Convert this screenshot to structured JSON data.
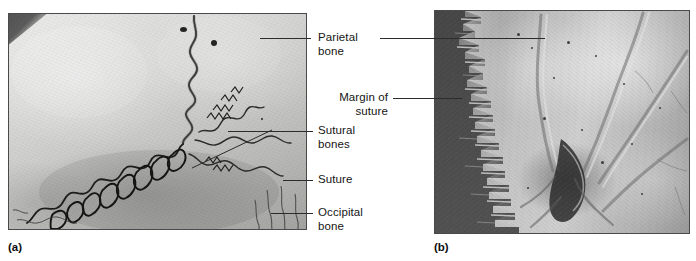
{
  "figure": {
    "panels": [
      {
        "letter": "(a)",
        "kind": "gross-photograph",
        "description": "Photograph of the external surface of a dried skull showing the occipital and parietal bones joined by a deeply interdigitating suture containing sutural (Wormian) bones."
      },
      {
        "letter": "(b)",
        "kind": "scanning-electron-micrograph",
        "description": "Scanning electron micrograph of a cut cranial suture showing the parietal bone and the jagged interlocking margin of the suture."
      }
    ],
    "labels": [
      {
        "id": "parietal-bone",
        "text": "Parietal\nbone",
        "align": "left"
      },
      {
        "id": "sutural-bones",
        "text": "Sutural\nbones",
        "align": "left"
      },
      {
        "id": "suture",
        "text": "Suture",
        "align": "left"
      },
      {
        "id": "occipital-bone",
        "text": "Occipital\nbone",
        "align": "left"
      },
      {
        "id": "margin-of-suture",
        "text": "Margin of\nsuture",
        "align": "right"
      }
    ],
    "colors": {
      "leader_line": "#2c2c2c",
      "label_text": "#151515",
      "panel_border": "#4a4a4a",
      "panel_a_bone": "#d6d6d3",
      "panel_b_highlight": "#cfcfcf",
      "panel_b_shadow": "#5f5f5f",
      "page_background": "#ffffff"
    }
  }
}
